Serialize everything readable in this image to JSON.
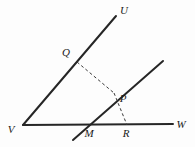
{
  "figure": {
    "name": "angle-with-transversal-diagram",
    "type": "geometry-diagram",
    "background_color": "#fdfdfd",
    "solid_line_color": "#262626",
    "dashed_line_color": "#3a3a3a",
    "label_color": "#1a1a1a",
    "solid_line_width": 2,
    "dashed_line_width": 1,
    "dash_pattern": "3,2.5",
    "width": 195,
    "height": 147
  },
  "labels": {
    "U": "U",
    "Q": "Q",
    "P": "P",
    "V": "V",
    "M": "M",
    "R": "R",
    "W": "W"
  },
  "points": {
    "V": {
      "x": 23,
      "y": 125
    },
    "U": {
      "x": 116,
      "y": 16
    },
    "W": {
      "x": 173,
      "y": 124
    },
    "Q": {
      "x": 77,
      "y": 62
    },
    "M": {
      "x": 84,
      "y": 125
    },
    "P": {
      "x": 114,
      "y": 93
    },
    "R": {
      "x": 127,
      "y": 125
    },
    "ray_ul_end": {
      "x": 163,
      "y": 61
    },
    "ray_ll_end": {
      "x": 73,
      "y": 140
    }
  },
  "label_positions": {
    "U": {
      "x": 124,
      "y": 14
    },
    "Q": {
      "x": 66,
      "y": 56
    },
    "P": {
      "x": 123,
      "y": 102
    },
    "V": {
      "x": 11,
      "y": 133
    },
    "M": {
      "x": 89,
      "y": 137
    },
    "R": {
      "x": 126,
      "y": 137
    },
    "W": {
      "x": 181,
      "y": 128
    }
  },
  "segments": [
    {
      "name": "ray-VU",
      "from": "V",
      "to": "U",
      "style": "solid"
    },
    {
      "name": "ray-VW",
      "from": "V",
      "to": "W",
      "style": "solid"
    },
    {
      "name": "line-through-M-and-P",
      "from": "ray_ll_end",
      "to": "ray_ul_end",
      "style": "solid"
    },
    {
      "name": "dashed-segment-QP",
      "from": "Q",
      "to": "P",
      "style": "dashed"
    },
    {
      "name": "dashed-segment-PR",
      "from": "P",
      "to": "R",
      "style": "dashed"
    }
  ]
}
